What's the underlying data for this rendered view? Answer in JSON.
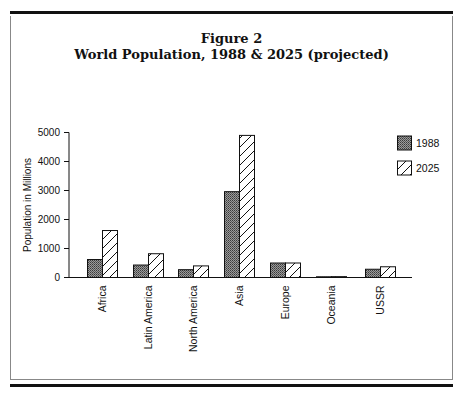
{
  "figure": {
    "label": "Figure 2",
    "title": "World Population, 1988 & 2025 (projected)"
  },
  "chart_data": {
    "type": "bar",
    "title": "World Population, 1988 & 2025 (projected)",
    "figure_label": "Figure 2",
    "xlabel": "",
    "ylabel": "Population in Millions",
    "ylim": [
      0,
      5000
    ],
    "yticks": [
      0,
      1000,
      2000,
      3000,
      4000,
      5000
    ],
    "grid": false,
    "legend_position": "upper right",
    "categories": [
      "Africa",
      "Latin America",
      "North America",
      "Asia",
      "Europe",
      "Oceania",
      "USSR"
    ],
    "series": [
      {
        "name": "1988",
        "pattern": "dense-crosshatch",
        "values": [
          620,
          430,
          270,
          2960,
          500,
          25,
          285
        ]
      },
      {
        "name": "2025",
        "pattern": "diagonal-hatch",
        "values": [
          1620,
          820,
          400,
          4900,
          500,
          30,
          370
        ]
      }
    ]
  }
}
